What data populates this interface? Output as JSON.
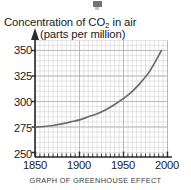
{
  "figure": {
    "caption": "GRAPH OF GREENHOUSE EFFECT",
    "top_artifact": "cropped-mark"
  },
  "colors": {
    "curve": "#6b6b6b",
    "axis": "#2b2b2b",
    "grid_minor": "#d8d8d8",
    "grid_major": "#b4b4b4",
    "text": "#1a1a1a",
    "caption": "#3a3a3a",
    "background": "#ffffff"
  },
  "chart_data": {
    "type": "line",
    "title": "Concentration of CO2 in air",
    "title_prefix": "Concentration of CO",
    "title_sub": "2",
    "title_suffix": " in air",
    "subtitle": "(parts per million)",
    "xlabel": "",
    "ylabel": "",
    "xlim": [
      1840,
      2010
    ],
    "ylim": [
      250,
      355
    ],
    "xticks": [
      1850,
      1900,
      1950,
      2000
    ],
    "yticks": [
      250,
      275,
      300,
      325,
      350
    ],
    "xtick_labels": [
      "1850",
      "1900",
      "1950",
      "2000"
    ],
    "ytick_labels": [
      "250",
      "275",
      "300",
      "325",
      "350"
    ],
    "grid": true,
    "grid_minor_step_x": 5,
    "grid_minor_step_y": 5,
    "legend": null,
    "series": [
      {
        "name": "CO2 concentration",
        "x": [
          1850,
          1860,
          1870,
          1880,
          1890,
          1900,
          1910,
          1920,
          1930,
          1940,
          1950,
          1960,
          1970,
          1980,
          1990,
          1993
        ],
        "values": [
          275,
          275.5,
          276.5,
          278,
          280,
          282,
          285,
          288,
          292,
          297,
          303,
          310,
          319,
          330,
          345,
          350
        ]
      }
    ]
  }
}
